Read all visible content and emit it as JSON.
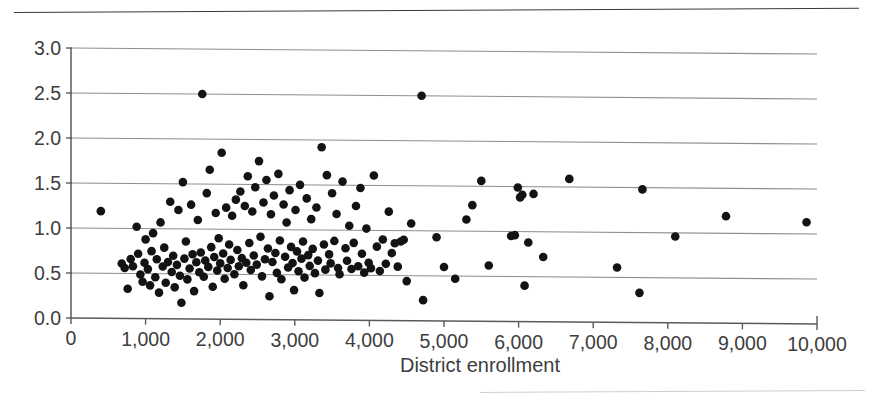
{
  "figure": {
    "top_rule": "horizontal-rule",
    "bottom_rule": "horizontal-rule-faint"
  },
  "chart_data": {
    "type": "scatter",
    "title": "",
    "xlabel": "District enrollment",
    "ylabel": "",
    "xlim": [
      0,
      10000
    ],
    "ylim": [
      0,
      3.0
    ],
    "xticks": [
      0,
      1000,
      2000,
      3000,
      4000,
      5000,
      6000,
      7000,
      8000,
      9000,
      10000
    ],
    "xtick_labels": [
      "0",
      "1,000",
      "2,000",
      "3,000",
      "4,000",
      "5,000",
      "6,000",
      "7,000",
      "8,000",
      "9,000",
      "10,000"
    ],
    "yticks": [
      0.0,
      0.5,
      1.0,
      1.5,
      2.0,
      2.5,
      3.0
    ],
    "ytick_labels": [
      "0.0",
      "0.5",
      "1.0",
      "1.5",
      "2.0",
      "2.5",
      "3.0"
    ],
    "grid": "horizontal",
    "legend": null,
    "marker": {
      "shape": "circle",
      "color": "#131313",
      "size_px": 8.6
    },
    "n_points": 181,
    "points": [
      [
        400,
        1.19
      ],
      [
        680,
        0.61
      ],
      [
        720,
        0.56
      ],
      [
        760,
        0.33
      ],
      [
        800,
        0.66
      ],
      [
        830,
        0.58
      ],
      [
        880,
        1.02
      ],
      [
        900,
        0.72
      ],
      [
        930,
        0.49
      ],
      [
        960,
        0.41
      ],
      [
        985,
        0.62
      ],
      [
        1000,
        0.88
      ],
      [
        1030,
        0.55
      ],
      [
        1060,
        0.37
      ],
      [
        1080,
        0.75
      ],
      [
        1100,
        0.95
      ],
      [
        1130,
        0.46
      ],
      [
        1150,
        0.66
      ],
      [
        1180,
        0.29
      ],
      [
        1200,
        1.07
      ],
      [
        1230,
        0.58
      ],
      [
        1250,
        0.79
      ],
      [
        1270,
        0.4
      ],
      [
        1300,
        0.63
      ],
      [
        1330,
        1.3
      ],
      [
        1350,
        0.52
      ],
      [
        1370,
        0.7
      ],
      [
        1390,
        0.35
      ],
      [
        1420,
        0.6
      ],
      [
        1440,
        1.21
      ],
      [
        1460,
        0.48
      ],
      [
        1480,
        0.18
      ],
      [
        1500,
        1.52
      ],
      [
        1520,
        0.67
      ],
      [
        1540,
        0.86
      ],
      [
        1560,
        0.44
      ],
      [
        1590,
        0.56
      ],
      [
        1610,
        1.27
      ],
      [
        1630,
        0.72
      ],
      [
        1650,
        0.31
      ],
      [
        1680,
        0.63
      ],
      [
        1700,
        1.1
      ],
      [
        1720,
        0.52
      ],
      [
        1740,
        0.74
      ],
      [
        1760,
        2.5
      ],
      [
        1780,
        0.47
      ],
      [
        1800,
        0.65
      ],
      [
        1820,
        1.4
      ],
      [
        1840,
        0.58
      ],
      [
        1860,
        1.66
      ],
      [
        1880,
        0.8
      ],
      [
        1900,
        0.36
      ],
      [
        1920,
        0.69
      ],
      [
        1940,
        1.18
      ],
      [
        1960,
        0.54
      ],
      [
        1980,
        0.9
      ],
      [
        2000,
        0.62
      ],
      [
        2020,
        1.85
      ],
      [
        2040,
        0.73
      ],
      [
        2060,
        0.45
      ],
      [
        2080,
        1.24
      ],
      [
        2100,
        0.57
      ],
      [
        2120,
        0.83
      ],
      [
        2140,
        0.66
      ],
      [
        2160,
        1.15
      ],
      [
        2190,
        0.5
      ],
      [
        2210,
        1.33
      ],
      [
        2230,
        0.77
      ],
      [
        2250,
        0.59
      ],
      [
        2270,
        1.42
      ],
      [
        2290,
        0.68
      ],
      [
        2310,
        0.38
      ],
      [
        2330,
        1.26
      ],
      [
        2350,
        0.63
      ],
      [
        2370,
        1.59
      ],
      [
        2390,
        0.85
      ],
      [
        2410,
        0.55
      ],
      [
        2430,
        1.2
      ],
      [
        2450,
        0.71
      ],
      [
        2470,
        1.47
      ],
      [
        2490,
        0.61
      ],
      [
        2520,
        1.76
      ],
      [
        2540,
        0.92
      ],
      [
        2560,
        0.48
      ],
      [
        2580,
        1.3
      ],
      [
        2600,
        0.67
      ],
      [
        2620,
        1.55
      ],
      [
        2640,
        0.79
      ],
      [
        2660,
        0.26
      ],
      [
        2680,
        1.17
      ],
      [
        2700,
        0.64
      ],
      [
        2720,
        1.38
      ],
      [
        2740,
        0.74
      ],
      [
        2760,
        0.52
      ],
      [
        2780,
        1.62
      ],
      [
        2800,
        0.88
      ],
      [
        2820,
        0.45
      ],
      [
        2850,
        1.28
      ],
      [
        2870,
        0.7
      ],
      [
        2890,
        1.08
      ],
      [
        2910,
        0.58
      ],
      [
        2930,
        1.44
      ],
      [
        2950,
        0.81
      ],
      [
        2970,
        0.63
      ],
      [
        2990,
        0.33
      ],
      [
        3010,
        1.22
      ],
      [
        3030,
        0.76
      ],
      [
        3050,
        0.54
      ],
      [
        3070,
        1.5
      ],
      [
        3090,
        0.68
      ],
      [
        3110,
        0.87
      ],
      [
        3130,
        0.47
      ],
      [
        3160,
        1.35
      ],
      [
        3180,
        0.72
      ],
      [
        3200,
        0.6
      ],
      [
        3220,
        1.12
      ],
      [
        3240,
        0.79
      ],
      [
        3270,
        0.52
      ],
      [
        3290,
        1.25
      ],
      [
        3310,
        0.66
      ],
      [
        3330,
        0.3
      ],
      [
        3360,
        1.92
      ],
      [
        3390,
        0.84
      ],
      [
        3410,
        0.56
      ],
      [
        3430,
        1.61
      ],
      [
        3460,
        0.73
      ],
      [
        3480,
        0.63
      ],
      [
        3500,
        1.41
      ],
      [
        3530,
        0.88
      ],
      [
        3560,
        1.18
      ],
      [
        3580,
        0.58
      ],
      [
        3600,
        0.51
      ],
      [
        3640,
        1.54
      ],
      [
        3680,
        0.8
      ],
      [
        3700,
        0.66
      ],
      [
        3730,
        1.05
      ],
      [
        3760,
        0.57
      ],
      [
        3790,
        0.86
      ],
      [
        3820,
        1.27
      ],
      [
        3850,
        0.6
      ],
      [
        3880,
        1.47
      ],
      [
        3900,
        0.74
      ],
      [
        3930,
        0.53
      ],
      [
        3960,
        1.02
      ],
      [
        3990,
        0.64
      ],
      [
        4020,
        0.58
      ],
      [
        4060,
        1.61
      ],
      [
        4100,
        0.82
      ],
      [
        4140,
        0.55
      ],
      [
        4180,
        0.9
      ],
      [
        4220,
        0.63
      ],
      [
        4260,
        1.21
      ],
      [
        4300,
        0.75
      ],
      [
        4340,
        0.86
      ],
      [
        4380,
        0.6
      ],
      [
        4420,
        0.88
      ],
      [
        4460,
        0.9
      ],
      [
        4500,
        0.44
      ],
      [
        4560,
        1.08
      ],
      [
        4700,
        2.5
      ],
      [
        4720,
        0.23
      ],
      [
        4900,
        0.93
      ],
      [
        5000,
        0.6
      ],
      [
        5150,
        0.47
      ],
      [
        5300,
        1.13
      ],
      [
        5380,
        1.29
      ],
      [
        5500,
        1.56
      ],
      [
        5600,
        0.62
      ],
      [
        5900,
        0.95
      ],
      [
        5950,
        0.96
      ],
      [
        5990,
        1.49
      ],
      [
        6020,
        1.38
      ],
      [
        6050,
        1.41
      ],
      [
        6080,
        0.4
      ],
      [
        6130,
        0.88
      ],
      [
        6200,
        1.42
      ],
      [
        6330,
        0.72
      ],
      [
        6680,
        1.59
      ],
      [
        7320,
        0.61
      ],
      [
        7620,
        0.33
      ],
      [
        7660,
        1.48
      ],
      [
        8100,
        0.96
      ],
      [
        8780,
        1.19
      ],
      [
        9860,
        1.13
      ]
    ]
  }
}
